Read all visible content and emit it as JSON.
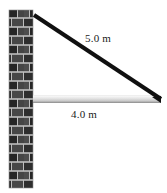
{
  "figure": {
    "name": "cable-supported-beam-diagram",
    "width": 167,
    "height": 193,
    "background_color": "#ffffff"
  },
  "labels": {
    "cable_length": "5.0 m",
    "beam_length": "4.0 m"
  },
  "elements": {
    "wall": {
      "name": "brick-wall",
      "x": 9,
      "y": 10,
      "width": 24,
      "height": 178,
      "brick_color": "#2b2b2b",
      "brick_color_alt": "#4a4a4a",
      "mortar_color": "#b8b8b8",
      "brick_row_height": 9,
      "brick_width": 12
    },
    "beam": {
      "name": "horizontal-beam",
      "x1": 33,
      "y1": 99,
      "x2": 161,
      "thickness": 7,
      "color_top": "#fcfcfc",
      "color_mid": "#d8d8d8",
      "color_bottom": "#9e9e9e"
    },
    "cable": {
      "name": "diagonal-cable",
      "x1": 34,
      "y1": 15,
      "x2": 161,
      "y2": 99,
      "thickness": 4,
      "color": "#101010"
    }
  }
}
